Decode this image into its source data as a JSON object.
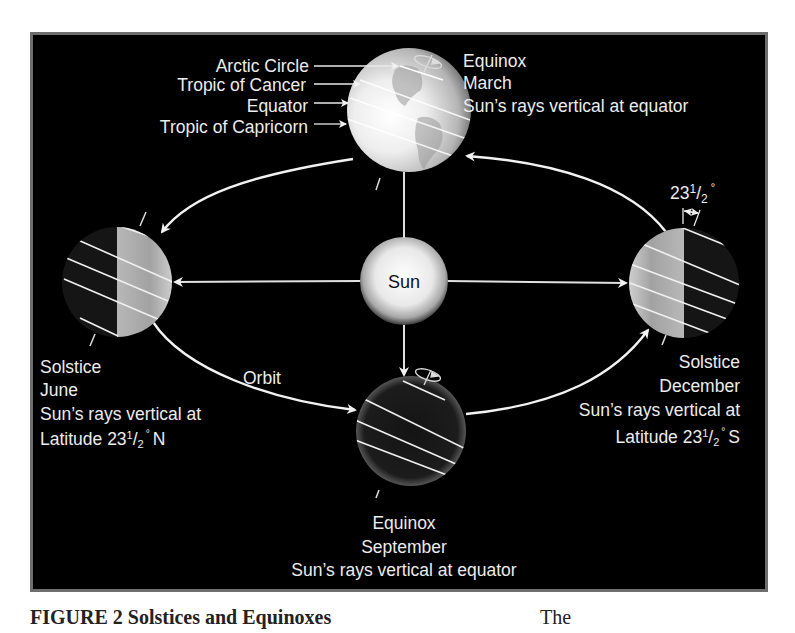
{
  "figure": {
    "colors": {
      "background": "#000000",
      "frame": "#6e6e6e",
      "text": "#ececec",
      "orbit": "#f2f2f2",
      "sun_core": "#f4f4f4"
    },
    "sun": {
      "label": "Sun"
    },
    "orbit": {
      "label": "Orbit"
    },
    "latitude_labels": [
      "Arctic Circle",
      "Tropic of Cancer",
      "Equator",
      "Tropic of Capricorn"
    ],
    "positions": {
      "march": {
        "event": "Equinox",
        "month": "March",
        "note": "Sun’s rays vertical at equator"
      },
      "june": {
        "event": "Solstice",
        "month": "June",
        "note_line1": "Sun’s rays vertical at",
        "note_line2_prefix": "Latitude 23",
        "note_line2_suffix": "N"
      },
      "september": {
        "event": "Equinox",
        "month": "September",
        "note": "Sun’s rays vertical at equator"
      },
      "december": {
        "event": "Solstice",
        "month": "December",
        "note_line1": "Sun’s rays vertical at",
        "note_line2_prefix": "Latitude 23",
        "note_line2_suffix": "S"
      }
    },
    "tilt": {
      "whole": "23",
      "num": "1",
      "den": "2",
      "unit": "°"
    }
  },
  "caption": {
    "left": "FIGURE 2  Solstices and Equinoxes",
    "right": "The"
  }
}
